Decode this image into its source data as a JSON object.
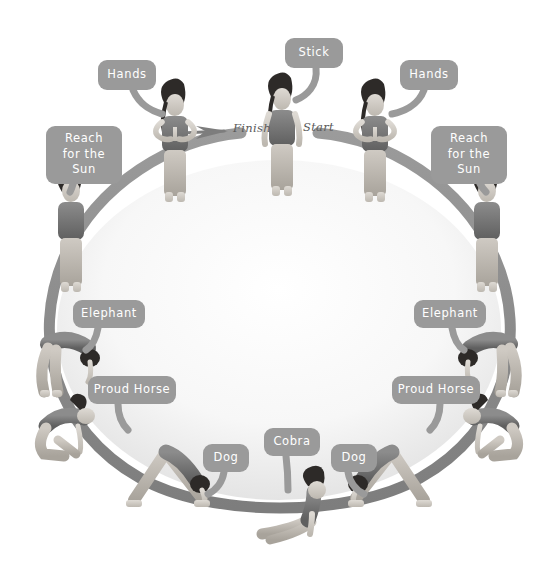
{
  "diagram": {
    "accent_color": "#9a9a9a",
    "ring_color": "#8a8a8a",
    "text_color": "#ffffff",
    "seq_text_color": "#5a5a5a",
    "background": "#ffffff",
    "sequence_markers": [
      {
        "id": "finish",
        "label": "Finish",
        "x": 233,
        "y": 121
      },
      {
        "id": "start",
        "label": "Start",
        "x": 303,
        "y": 120
      }
    ],
    "callouts": [
      {
        "id": "callout-stick",
        "label": "Stick",
        "x": 285,
        "y": 38,
        "w": 58,
        "h": 30,
        "lines": 1
      },
      {
        "id": "callout-hands-left",
        "label": "Hands",
        "x": 98,
        "y": 60,
        "w": 58,
        "h": 30,
        "lines": 1
      },
      {
        "id": "callout-hands-right",
        "label": "Hands",
        "x": 400,
        "y": 60,
        "w": 58,
        "h": 30,
        "lines": 1
      },
      {
        "id": "callout-sun-left",
        "label": "Reach for the Sun",
        "x": 46,
        "y": 126,
        "w": 76,
        "h": 45,
        "lines": 2
      },
      {
        "id": "callout-sun-right",
        "label": "Reach for the Sun",
        "x": 431,
        "y": 126,
        "w": 76,
        "h": 45,
        "lines": 2
      },
      {
        "id": "callout-elephant-left",
        "label": "Elephant",
        "x": 73,
        "y": 300,
        "w": 72,
        "h": 28,
        "lines": 1
      },
      {
        "id": "callout-elephant-right",
        "label": "Elephant",
        "x": 414,
        "y": 300,
        "w": 72,
        "h": 28,
        "lines": 1
      },
      {
        "id": "callout-horse-left",
        "label": "Proud Horse",
        "x": 88,
        "y": 376,
        "w": 88,
        "h": 28,
        "lines": 1
      },
      {
        "id": "callout-horse-right",
        "label": "Proud Horse",
        "x": 392,
        "y": 376,
        "w": 88,
        "h": 28,
        "lines": 1
      },
      {
        "id": "callout-dog-left",
        "label": "Dog",
        "x": 203,
        "y": 444,
        "w": 46,
        "h": 28,
        "lines": 1
      },
      {
        "id": "callout-cobra",
        "label": "Cobra",
        "x": 264,
        "y": 428,
        "w": 56,
        "h": 28,
        "lines": 1
      },
      {
        "id": "callout-dog-right",
        "label": "Dog",
        "x": 331,
        "y": 444,
        "w": 46,
        "h": 28,
        "lines": 1
      }
    ],
    "poses": [
      {
        "id": "pose-stick",
        "name": "Stick",
        "side": "center",
        "order": 1,
        "x": 258,
        "y": 84
      },
      {
        "id": "pose-hands-right",
        "name": "Hands",
        "side": "right",
        "order": 2,
        "x": 352,
        "y": 90
      },
      {
        "id": "pose-sun-right",
        "name": "Reach for the Sun",
        "side": "right",
        "order": 3,
        "x": 452,
        "y": 168
      },
      {
        "id": "pose-elephant-right",
        "name": "Elephant",
        "side": "right",
        "order": 4,
        "x": 452,
        "y": 326
      },
      {
        "id": "pose-horse-right",
        "name": "Proud Horse",
        "side": "right",
        "order": 5,
        "x": 444,
        "y": 412
      },
      {
        "id": "pose-dog-right",
        "name": "Dog",
        "side": "right",
        "order": 6,
        "x": 356,
        "y": 448
      },
      {
        "id": "pose-cobra",
        "name": "Cobra",
        "side": "center",
        "order": 7,
        "x": 258,
        "y": 470
      },
      {
        "id": "pose-dog-left",
        "name": "Dog",
        "side": "left",
        "order": 8,
        "x": 136,
        "y": 448
      },
      {
        "id": "pose-horse-left",
        "name": "Proud Horse",
        "side": "left",
        "order": 9,
        "x": 56,
        "y": 412
      },
      {
        "id": "pose-elephant-left",
        "name": "Elephant",
        "side": "left",
        "order": 10,
        "x": 26,
        "y": 326
      },
      {
        "id": "pose-sun-left",
        "name": "Reach for the Sun",
        "side": "left",
        "order": 11,
        "x": 40,
        "y": 168
      },
      {
        "id": "pose-hands-left",
        "name": "Hands",
        "side": "left",
        "order": 12,
        "x": 148,
        "y": 90
      }
    ]
  }
}
